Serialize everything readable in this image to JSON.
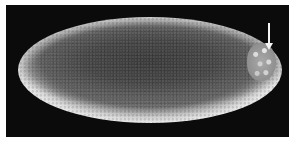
{
  "image": {
    "subject": "embryo (scanning electron micrograph)",
    "background_color": "#0b0b0b",
    "border_color": "#ffffff",
    "annotations": [
      {
        "type": "arrow",
        "points_to": "pole-cells",
        "direction": "down",
        "color": "#f4f4f4"
      }
    ]
  }
}
